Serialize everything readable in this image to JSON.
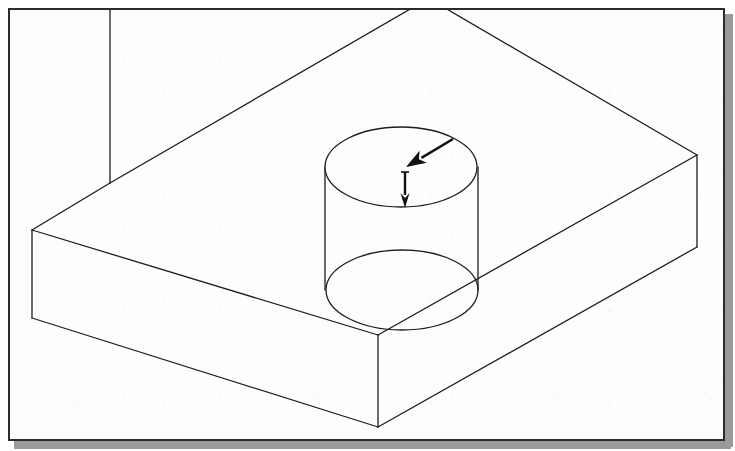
{
  "document": {
    "kind": "technical-drawing",
    "subject": "isometric-notched-block-with-cylindrical-boss",
    "background_color": "#ffffff",
    "paper_color": "#fdfdfd",
    "line_color": "#1d1d1d",
    "frame_color": "#2b2b2b",
    "shadow_color": "#9a9a9a",
    "arrow_color": "#111111"
  },
  "frame": {
    "x": 8,
    "y": 8,
    "width": 717,
    "height": 433,
    "border_width": 2,
    "shadow_offset": 10
  },
  "geometry": {
    "projection": "isometric",
    "block": {
      "name": "notched-rectangular-block",
      "top_face_points": "110,8 32,230 378,335 697,155 445,8 412,8",
      "left_front_face_points": "32,230 378,335 378,427 32,318",
      "right_front_face_points": "378,335 697,155 697,247 378,427",
      "vertices": {
        "notch_inner_top": [
          110,
          8
        ],
        "notch_inner_bottom": [
          110,
          183
        ],
        "left_top": [
          32,
          230
        ],
        "left_bottom": [
          32,
          318
        ],
        "front_top": [
          378,
          335
        ],
        "front_bottom": [
          378,
          427
        ],
        "right_top": [
          697,
          155
        ],
        "right_bottom": [
          697,
          247
        ],
        "back_apex_left": [
          412,
          8
        ],
        "back_apex_right": [
          445,
          8
        ]
      }
    },
    "cylinder": {
      "name": "cylindrical-boss",
      "top_ellipse": {
        "cx": 401,
        "cy": 167,
        "rx": 76,
        "ry": 40
      },
      "bottom_ellipse": {
        "cx": 402,
        "cy": 290,
        "rx": 76,
        "ry": 40
      },
      "left_silhouette": {
        "x": 325,
        "y1": 167,
        "y2": 290
      },
      "right_silhouette": {
        "x": 478,
        "y1": 167,
        "y2": 290
      },
      "height_px": 123
    }
  },
  "annotations": {
    "arrows": [
      {
        "name": "radius-pointer-arrow",
        "style": "solid-filled-head",
        "direction": "upper-right-to-lower-left",
        "tail": [
          453,
          139
        ],
        "tip": [
          406,
          167
        ]
      },
      {
        "name": "depth-pointer-arrow",
        "style": "solid-filled-head",
        "direction": "downward",
        "tail": [
          405,
          172
        ],
        "tip": [
          405,
          208
        ]
      }
    ]
  }
}
